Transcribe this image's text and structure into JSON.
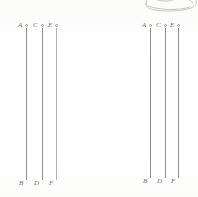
{
  "figure": {
    "caption": "",
    "background_color": "#fdfdfc",
    "line_color": "#8e8e8e",
    "label_color": "#6f6f6f",
    "groups": [
      {
        "name": "left-group",
        "lines": [
          {
            "top_label": "A",
            "bottom_label": "B",
            "marker": "open-circle"
          },
          {
            "top_label": "C",
            "bottom_label": "D",
            "marker": "open-circle"
          },
          {
            "top_label": "E",
            "bottom_label": "F",
            "marker": "open-circle"
          }
        ]
      },
      {
        "name": "right-group",
        "lines": [
          {
            "top_label": "A",
            "bottom_label": "B",
            "marker": "open-circle"
          },
          {
            "top_label": "C",
            "bottom_label": "D",
            "marker": "open-circle"
          },
          {
            "top_label": "E",
            "bottom_label": "F",
            "marker": "open-circle"
          }
        ]
      }
    ],
    "corner_sketch": {
      "name": "cropped-line-drawing",
      "description": "shoe-sketch"
    }
  }
}
